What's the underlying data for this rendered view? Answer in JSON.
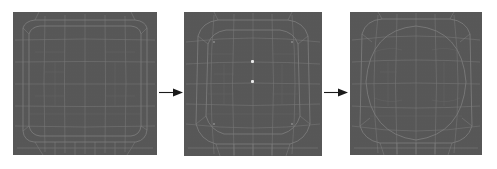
{
  "figure": {
    "title": "",
    "background_color": "#ffffff",
    "width": 497,
    "height": 169,
    "panel_fill_color": "#575757",
    "mesh_line_color": "#8d8d8d",
    "mesh_line_color_faint": "#6d6d6d",
    "marker_color": "#e8e8e8",
    "arrow_color": "#1a1a1a"
  },
  "panels": [
    {
      "id": "panel-1",
      "label": "initial-mesh",
      "caption": "",
      "x": 13,
      "y": 12,
      "width": 144,
      "height": 143,
      "state": "undeformed grid mesh",
      "markers": []
    },
    {
      "id": "panel-2",
      "label": "intermediate-mesh",
      "caption": "",
      "x": 184,
      "y": 12,
      "width": 138,
      "height": 144,
      "state": "partially deformed mesh with two seed points",
      "markers": [
        {
          "name": "seed-point-upper",
          "x": 67,
          "y": 48
        },
        {
          "name": "seed-point-lower",
          "x": 67,
          "y": 68
        }
      ]
    },
    {
      "id": "panel-3",
      "label": "final-mesh",
      "caption": "",
      "x": 350,
      "y": 12,
      "width": 132,
      "height": 143,
      "state": "fully deformed mesh",
      "markers": []
    }
  ],
  "arrows": [
    {
      "id": "arrow-1",
      "label": "step-1-to-2",
      "x": 159,
      "y": 87,
      "width": 24,
      "height": 11,
      "direction": "right"
    },
    {
      "id": "arrow-2",
      "label": "step-2-to-3",
      "x": 324,
      "y": 87,
      "width": 24,
      "height": 11,
      "direction": "right"
    }
  ],
  "chart_data": {
    "type": "diagram",
    "title": "",
    "stages": [
      "initial-mesh",
      "intermediate-mesh",
      "final-mesh"
    ],
    "marker_count": 2
  }
}
